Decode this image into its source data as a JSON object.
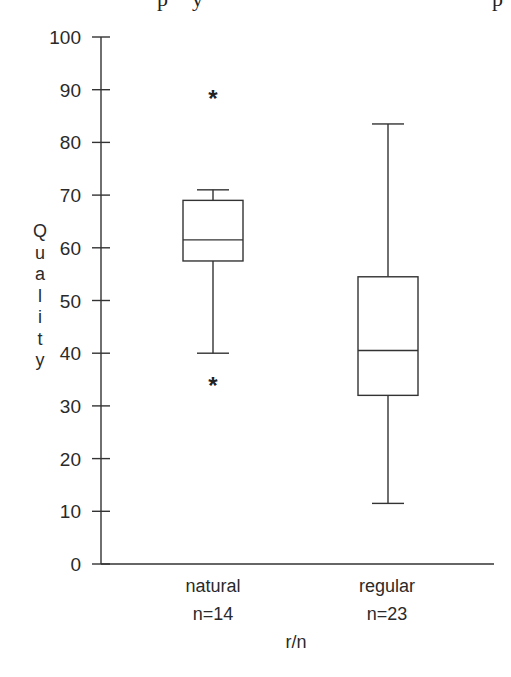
{
  "chart_data": {
    "type": "boxplot",
    "title": "",
    "xlabel": "r/n",
    "ylabel": "Quality",
    "ylim": [
      0,
      100
    ],
    "yticks": [
      0,
      10,
      20,
      30,
      40,
      50,
      60,
      70,
      80,
      90,
      100
    ],
    "grid": false,
    "legend": null,
    "categories": [
      "natural",
      "regular"
    ],
    "sample_sizes": [
      "n=14",
      "n=23"
    ],
    "series": [
      {
        "name": "natural",
        "n": 14,
        "whisker_low": 40,
        "q1": 57.5,
        "median": 61.5,
        "q3": 69,
        "whisker_high": 71,
        "outliers": [
          89,
          34.5
        ]
      },
      {
        "name": "regular",
        "n": 23,
        "whisker_low": 11.5,
        "q1": 32,
        "median": 40.5,
        "q3": 54.5,
        "whisker_high": 83.5,
        "outliers": []
      }
    ],
    "outlier_marker": "*"
  },
  "labels": {
    "ylabel_letters": [
      "Q",
      "u",
      "a",
      "l",
      "i",
      "t",
      "y"
    ],
    "xlabel": "r/n",
    "categories": [
      "natural",
      "regular"
    ],
    "sample_sizes": [
      "n=14",
      "n=23"
    ]
  },
  "cropped_text_fragments": [
    "p",
    "y",
    "p"
  ]
}
